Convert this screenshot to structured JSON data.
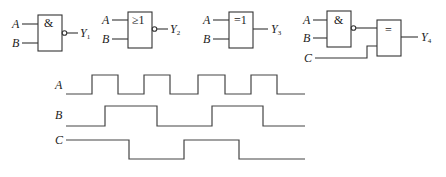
{
  "gates": [
    {
      "id": "g1",
      "type": "NAND",
      "symbol": "&",
      "inputs": [
        "A",
        "B"
      ],
      "output": "Y",
      "output_sub": "1",
      "inverted_output": true
    },
    {
      "id": "g2",
      "type": "NOR",
      "symbol": "≥1",
      "inputs": [
        "A",
        "B"
      ],
      "output": "Y",
      "output_sub": "2",
      "inverted_output": true
    },
    {
      "id": "g3",
      "type": "XOR",
      "symbol": "=1",
      "inputs": [
        "A",
        "B"
      ],
      "output": "Y",
      "output_sub": "3",
      "inverted_output": false
    },
    {
      "id": "g4a",
      "type": "NAND",
      "symbol": "&",
      "inputs": [
        "A",
        "B"
      ],
      "inverted_output": true
    },
    {
      "id": "g4b",
      "type": "XNOR",
      "symbol": "=",
      "inputs": [
        "NAND(A,B)",
        "C"
      ],
      "output": "Y",
      "output_sub": "4",
      "inverted_output": false
    }
  ],
  "labels": {
    "A": "A",
    "B": "B",
    "C": "C",
    "Y": "Y"
  },
  "waveforms": {
    "A": {
      "label": "A",
      "initial": 0,
      "transitions_x": [
        92,
        118,
        144,
        170,
        198,
        225,
        251,
        277
      ],
      "end_x": 305
    },
    "B": {
      "label": "B",
      "initial": 0,
      "transitions_x": [
        105,
        157,
        212,
        263
      ],
      "end_x": 305
    },
    "C": {
      "label": "C",
      "initial": 1,
      "transitions_x": [
        129,
        184,
        239
      ],
      "end_x": 305
    }
  }
}
